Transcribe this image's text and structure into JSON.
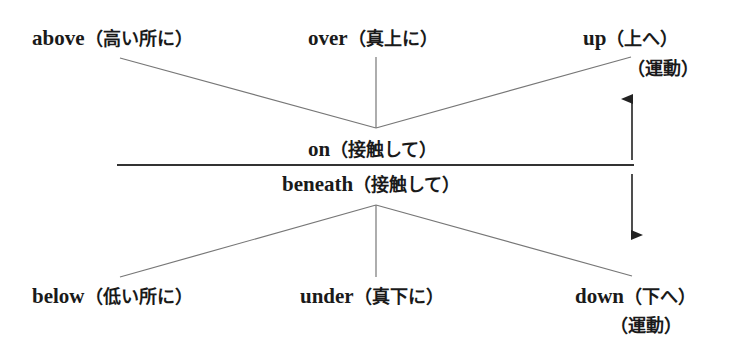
{
  "diagram": {
    "type": "preposition-spatial-diagram",
    "surface_line": "horizontal reference line",
    "labels": {
      "above": {
        "word": "above",
        "gloss": "（高い所に）"
      },
      "over": {
        "word": "over",
        "gloss": "（真上に）"
      },
      "up": {
        "word": "up",
        "gloss": "（上へ）",
        "note": "（運動）"
      },
      "on": {
        "word": "on",
        "gloss": "（接触して）"
      },
      "beneath": {
        "word": "beneath",
        "gloss": "（接触して）"
      },
      "below": {
        "word": "below",
        "gloss": "（低い所に）"
      },
      "under": {
        "word": "under",
        "gloss": "（真下に）"
      },
      "down": {
        "word": "down",
        "gloss": "（下へ）",
        "note": "（運動）"
      }
    },
    "arrows": [
      "up-arrow",
      "down-arrow"
    ],
    "colors": {
      "line": "#777777",
      "surface": "#333333",
      "text": "#1a1a1a"
    }
  }
}
